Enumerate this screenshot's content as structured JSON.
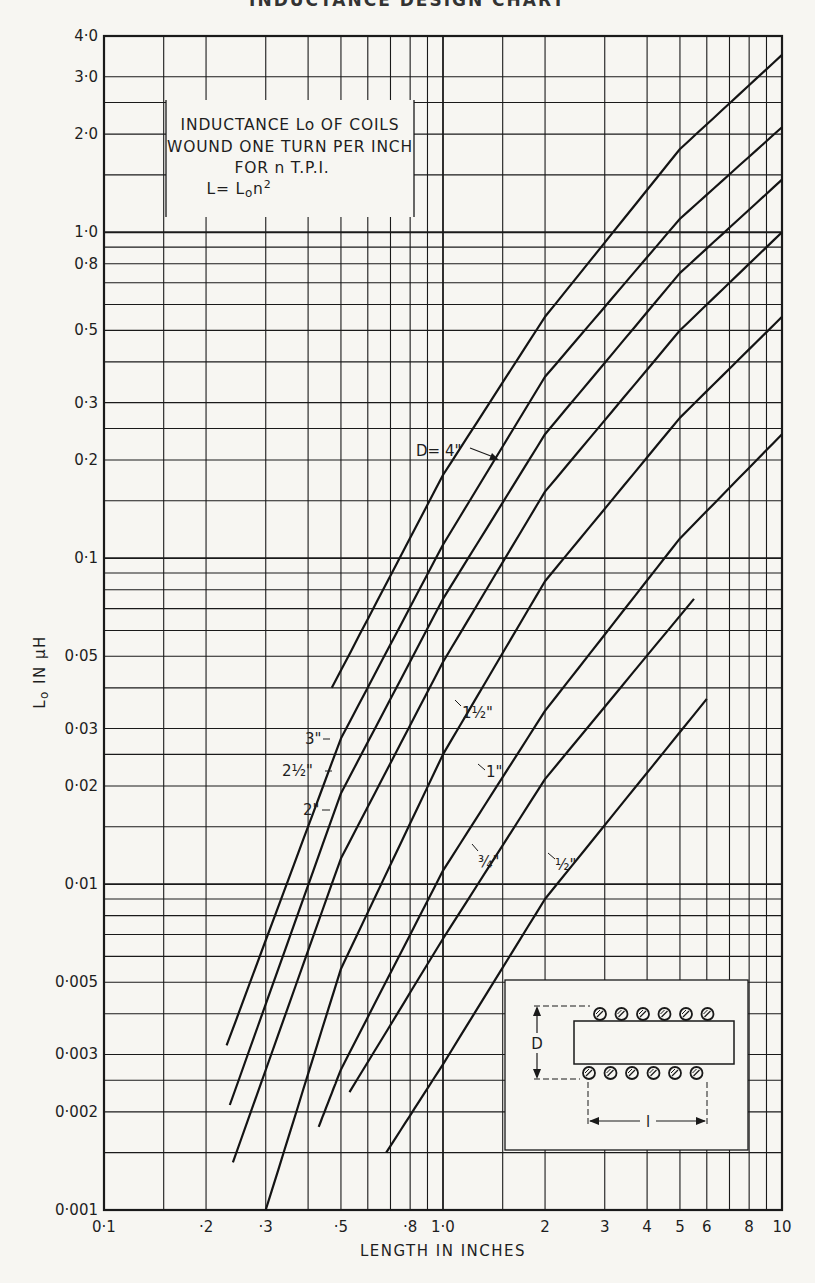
{
  "header": {
    "cut_off_title": "INDUCTANCE DESIGN CHART"
  },
  "chart_data": {
    "type": "line",
    "title": "INDUCTANCE Lo OF COILS WOUND ONE TURN PER INCH FOR n T.P.I.",
    "title_lines": [
      "INDUCTANCE  Lo OF COILS",
      "WOUND ONE TURN PER INCH",
      "FOR n  T.P.I.",
      "L= Lon2"
    ],
    "formula": "L = Lo n²",
    "xlabel": "LENGTH IN INCHES",
    "ylabel": "Lo IN µH",
    "xscale": "log",
    "yscale": "log",
    "xlim": [
      0.1,
      10
    ],
    "ylim": [
      0.001,
      4.0
    ],
    "grid": true,
    "x_tick_labels": [
      "0·1",
      "·2",
      "·3",
      "·5",
      "·8",
      "1·0",
      "2",
      "3",
      "4",
      "5",
      "6",
      "8",
      "10"
    ],
    "x_tick_values": [
      0.1,
      0.2,
      0.3,
      0.5,
      0.8,
      1.0,
      2,
      3,
      4,
      5,
      6,
      8,
      10
    ],
    "y_tick_labels": [
      "4·0",
      "3·0",
      "2·0",
      "1·0",
      "0·8",
      "0·5",
      "0·3",
      "0·2",
      "0·1",
      "0·05",
      "0·03",
      "0·02",
      "0·01",
      "0·005",
      "0·003",
      "0·002",
      "0·001"
    ],
    "y_tick_values": [
      4.0,
      3.0,
      2.0,
      1.0,
      0.8,
      0.5,
      0.3,
      0.2,
      0.1,
      0.05,
      0.03,
      0.02,
      0.01,
      0.005,
      0.003,
      0.002,
      0.001
    ],
    "series": [
      {
        "name": "D = 4\"",
        "label": "D= 4\"",
        "x": [
          0.47,
          1.0,
          2.0,
          5.0,
          10.0
        ],
        "y": [
          0.04,
          0.18,
          0.55,
          1.8,
          3.5
        ]
      },
      {
        "name": "D = 3\"",
        "label": "3\"",
        "x": [
          0.23,
          0.5,
          1.0,
          2.0,
          5.0,
          10.0
        ],
        "y": [
          0.0032,
          0.028,
          0.11,
          0.36,
          1.1,
          2.1
        ]
      },
      {
        "name": "D = 2½\"",
        "label": "2½\"",
        "x": [
          0.235,
          0.5,
          1.0,
          2.0,
          5.0,
          10.0
        ],
        "y": [
          0.0021,
          0.019,
          0.075,
          0.24,
          0.75,
          1.45
        ]
      },
      {
        "name": "D = 2\"",
        "label": "2\"",
        "x": [
          0.24,
          0.5,
          1.0,
          2.0,
          5.0,
          10.0
        ],
        "y": [
          0.0014,
          0.012,
          0.048,
          0.16,
          0.5,
          1.0
        ]
      },
      {
        "name": "D = 1½\"",
        "label": "1½\"",
        "x": [
          0.3,
          0.5,
          1.0,
          2.0,
          5.0,
          10.0
        ],
        "y": [
          0.001,
          0.0055,
          0.025,
          0.085,
          0.27,
          0.55
        ]
      },
      {
        "name": "D = 1\"",
        "label": "1\"",
        "x": [
          0.43,
          0.5,
          1.0,
          2.0,
          5.0,
          10.0
        ],
        "y": [
          0.0018,
          0.0027,
          0.011,
          0.034,
          0.115,
          0.24
        ]
      },
      {
        "name": "D = ¾\"",
        "label": "¾\"",
        "x": [
          0.53,
          1.0,
          2.0,
          5.5
        ],
        "y": [
          0.0023,
          0.0068,
          0.021,
          0.075
        ]
      },
      {
        "name": "D = ½\"",
        "label": "½\"",
        "x": [
          0.68,
          1.0,
          2.0,
          6.0
        ],
        "y": [
          0.0015,
          0.0028,
          0.009,
          0.037
        ]
      }
    ],
    "inset": {
      "description": "Coil cross-section diagram",
      "dimension_diameter": "D",
      "dimension_length": "l",
      "turns_shown": 6
    }
  }
}
